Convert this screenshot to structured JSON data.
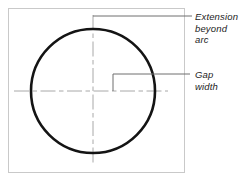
{
  "figure": {
    "frame": {
      "name": "drawing-frame",
      "x": 8,
      "y": 8,
      "width": 176,
      "height": 164,
      "stroke_color": "#c9c9c9",
      "fill_color": "#ffffff",
      "stroke_width": 1
    },
    "circle": {
      "name": "arc-circle",
      "cx": 93,
      "cy": 91,
      "r": 62,
      "stroke_color": "#141414",
      "stroke_width": 2.6,
      "fill": "none"
    },
    "centerlines": {
      "stroke_color": "#a8a8a8",
      "stroke_width": 1,
      "dash_pattern": "14 3 4 3",
      "vertical": {
        "name": "vertical-centerline",
        "x": 93,
        "y1": 15,
        "y2": 166
      },
      "horizontal": {
        "name": "horizontal-centerline",
        "y": 91,
        "x1": 14,
        "x2": 168
      }
    },
    "gap_bracket": {
      "name": "gap-width-bracket",
      "stroke_color": "#6e6e6e",
      "stroke_width": 1,
      "tick_x": 113,
      "tick_y_top": 74,
      "tick_y_bottom": 91,
      "arm_x_end": 190,
      "arm_y": 74
    },
    "leaders": [
      {
        "name": "leader-extension-beyond-arc",
        "x1": 93,
        "y1": 16,
        "x2": 192,
        "y2": 16,
        "stroke_color": "#6e6e6e",
        "stroke_width": 1
      },
      {
        "name": "leader-gap-width",
        "x1": 113,
        "y1": 74,
        "x2": 192,
        "y2": 74,
        "stroke_color": "#6e6e6e",
        "stroke_width": 1
      }
    ]
  },
  "labels": {
    "extension": "Extension\nbeyond\narc",
    "gap": "Gap\nwidth"
  },
  "colors": {
    "arc": "#141414",
    "centerline": "#a8a8a8",
    "leader": "#6e6e6e",
    "frame": "#c9c9c9",
    "text": "#1c1c1c",
    "background": "#ffffff"
  }
}
